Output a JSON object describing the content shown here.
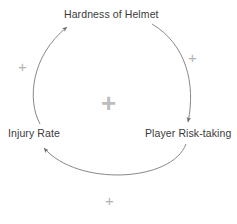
{
  "diagram": {
    "type": "causal-loop-diagram",
    "background_color": "#ffffff",
    "nodes": [
      {
        "id": "hardness-of-helmet",
        "label": "Hardness of Helmet"
      },
      {
        "id": "injury-rate",
        "label": "Injury Rate"
      },
      {
        "id": "player-risk-taking",
        "label": "Player Risk-taking"
      }
    ],
    "links": [
      {
        "id": "helmet-to-risk",
        "from": "Hardness of Helmet",
        "to": "Player Risk-taking",
        "polarity": "+"
      },
      {
        "id": "risk-to-injury",
        "from": "Player Risk-taking",
        "to": "Injury Rate",
        "polarity": "+"
      },
      {
        "id": "injury-to-helmet",
        "from": "Injury Rate",
        "to": "Hardness of Helmet",
        "polarity": "+"
      }
    ],
    "loop_polarity": "+",
    "colors": {
      "text": "#3a3a3a",
      "arrow": "#7a7a7a",
      "polarity": "#b3b3b3",
      "loop_polarity": "#bdbdbd"
    }
  }
}
